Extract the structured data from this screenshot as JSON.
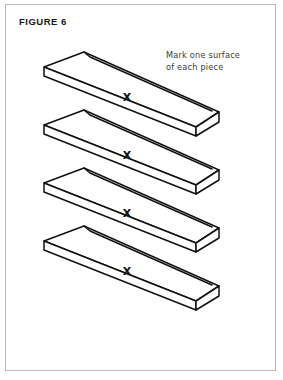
{
  "figure": {
    "title": "FIGURE 6",
    "annotation": {
      "line1": "Mark one surface",
      "line2": "of each piece"
    },
    "mark_label": "X",
    "panel": {
      "border_color": "#b9b9b9",
      "background_color": "#ffffff",
      "line_color": "#111111"
    },
    "pieces": [
      {
        "id": "piece-1",
        "mark": "X",
        "mark_x": 121,
        "mark_y": 96
      },
      {
        "id": "piece-2",
        "mark": "X",
        "mark_x": 121,
        "mark_y": 154
      },
      {
        "id": "piece-3",
        "mark": "X",
        "mark_x": 121,
        "mark_y": 212
      },
      {
        "id": "piece-4",
        "mark": "X",
        "mark_x": 121,
        "mark_y": 270
      }
    ]
  }
}
